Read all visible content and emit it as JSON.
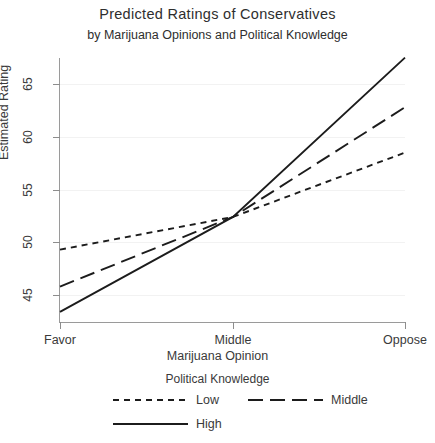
{
  "chart_data": {
    "type": "line",
    "title": "Predicted Ratings of Conservatives",
    "subtitle": "by Marijuana Opinions and Political Knowledge",
    "xlabel": "Marijuana Opinion",
    "ylabel": "Estimated Rating",
    "categories": [
      "Favor",
      "Middle",
      "Oppose"
    ],
    "x_ticklabels": [
      "Favor",
      "Middle",
      "Oppose"
    ],
    "y_ticklabels": [
      "45",
      "50",
      "55",
      "60",
      "65"
    ],
    "yticks": [
      45,
      50,
      55,
      60,
      65
    ],
    "ylim": [
      43.0,
      68.5
    ],
    "grid": true,
    "legend_title": "Political Knowledge",
    "legend_position": "bottom",
    "series": [
      {
        "name": "Low",
        "style": "short-dash",
        "color": "#1c1c1c",
        "values": [
          49.3,
          52.4,
          58.5
        ]
      },
      {
        "name": "Middle",
        "style": "long-dash",
        "color": "#1c1c1c",
        "values": [
          45.8,
          52.4,
          62.8
        ]
      },
      {
        "name": "High",
        "style": "solid",
        "color": "#1c1c1c",
        "values": [
          43.4,
          52.4,
          67.5
        ]
      }
    ],
    "annotations": []
  },
  "legend": {
    "title": "Political Knowledge",
    "items": [
      {
        "label": "Low"
      },
      {
        "label": "Middle"
      },
      {
        "label": "High"
      }
    ]
  }
}
